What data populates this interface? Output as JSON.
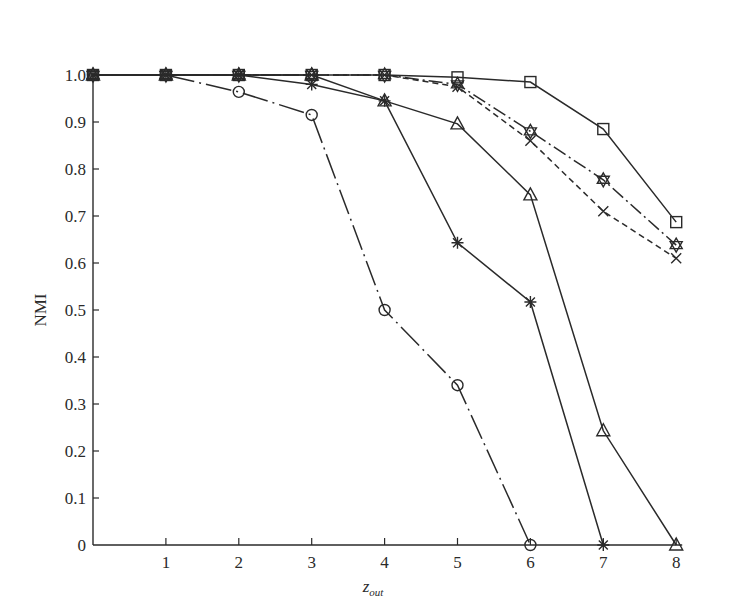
{
  "chart_data": {
    "type": "line",
    "title": "",
    "xlabel": "z_out",
    "xlabel_main": "z",
    "xlabel_sub": "out",
    "ylabel": "NMI",
    "xlim": [
      0,
      8
    ],
    "ylim": [
      0,
      1.0
    ],
    "grid": false,
    "legend": "none",
    "x": [
      0,
      1,
      2,
      3,
      4,
      5,
      6,
      7,
      8
    ],
    "x_tick_labels": [
      "1",
      "2",
      "3",
      "4",
      "5",
      "6",
      "7",
      "8"
    ],
    "y_tick_labels": [
      "0",
      "0.1",
      "0.2",
      "0.3",
      "0.4",
      "0.5",
      "0.6",
      "0.7",
      "0.8",
      "0.9",
      "1.0"
    ],
    "series": [
      {
        "name": "square",
        "marker": "square",
        "line": "solid",
        "values": [
          1.0,
          1.0,
          1.0,
          1.0,
          1.0,
          0.995,
          0.985,
          0.885,
          0.687
        ]
      },
      {
        "name": "star",
        "marker": "star",
        "line": "dashdot",
        "values": [
          1.0,
          1.0,
          1.0,
          1.0,
          1.0,
          0.98,
          0.88,
          0.777,
          0.638
        ]
      },
      {
        "name": "cross",
        "marker": "x",
        "line": "dashed",
        "values": [
          1.0,
          1.0,
          1.0,
          1.0,
          1.0,
          0.975,
          0.86,
          0.71,
          0.61
        ]
      },
      {
        "name": "triangle",
        "marker": "triangle",
        "line": "solid",
        "values": [
          1.0,
          1.0,
          1.0,
          1.0,
          0.945,
          0.896,
          0.745,
          0.243,
          0.0
        ]
      },
      {
        "name": "asterisk",
        "marker": "asterisk",
        "line": "solid",
        "values": [
          1.0,
          1.0,
          1.0,
          0.98,
          0.945,
          0.643,
          0.517,
          0.0,
          null
        ]
      },
      {
        "name": "circle",
        "marker": "circle",
        "line": "longdashdot",
        "values": [
          1.0,
          1.0,
          0.964,
          0.915,
          0.5,
          0.34,
          0.0,
          null,
          null
        ]
      }
    ]
  },
  "colors": {
    "ink": "#2a2a2a",
    "background": "#ffffff"
  }
}
